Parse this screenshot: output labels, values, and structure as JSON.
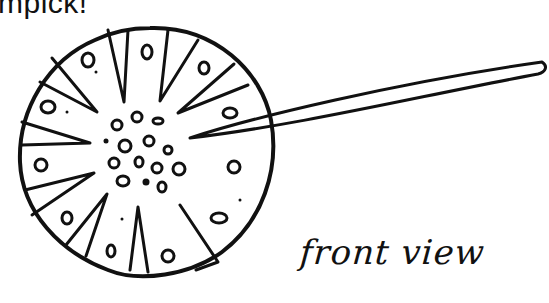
{
  "diagram": {
    "top_caption": "mpick!",
    "label": "front view",
    "stroke_color": "#111111",
    "background": "#ffffff",
    "disc": {
      "cx": 150,
      "cy": 160,
      "r": 123
    },
    "toothpick": {
      "tip_x": 190,
      "tip_y": 135,
      "end_x": 545,
      "end_y": 62
    },
    "rays": 12,
    "outer_holes": 12,
    "center_holes": 15
  }
}
